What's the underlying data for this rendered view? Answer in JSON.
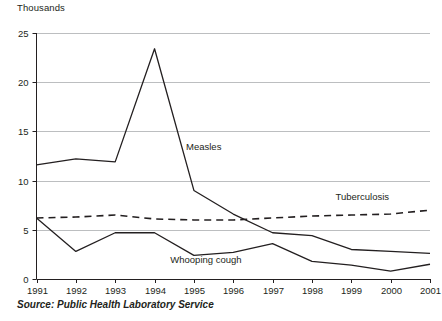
{
  "units_label": "Thousands",
  "source_note": "Source: Public Health Laboratory Service",
  "labels": {
    "measles": "Measles",
    "tuberculosis": "Tuberculosis",
    "whooping_cough": "Whooping cough"
  },
  "colors": {
    "line": "#231f20",
    "grid": "#bcbec0",
    "axis": "#231f20",
    "background": "#ffffff"
  },
  "chart_data": {
    "type": "line",
    "title": "",
    "subtitle": "",
    "xlabel": "",
    "ylabel": "Thousands",
    "xlim": [
      1991,
      2001
    ],
    "ylim": [
      0,
      25
    ],
    "yticks": [
      0,
      5,
      10,
      15,
      20,
      25
    ],
    "grid": true,
    "legend": "inline-labels",
    "categories": [
      1991,
      1992,
      1993,
      1994,
      1995,
      1996,
      1997,
      1998,
      1999,
      2000,
      2001
    ],
    "xtick_labels": [
      "1991",
      "1992",
      "1993",
      "1994",
      "1995",
      "1996",
      "1997",
      "1998",
      "1999",
      "2000",
      "2001"
    ],
    "ytick_labels": [
      "0",
      "5",
      "10",
      "15",
      "20",
      "25"
    ],
    "series": [
      {
        "name": "Measles",
        "style": "solid",
        "values": [
          11.6,
          12.2,
          11.9,
          23.4,
          9.0,
          6.6,
          4.7,
          4.4,
          3.0,
          2.8,
          2.6
        ]
      },
      {
        "name": "Tuberculosis",
        "style": "dashed",
        "values": [
          6.2,
          6.3,
          6.5,
          6.1,
          6.0,
          6.0,
          6.2,
          6.4,
          6.5,
          6.6,
          7.0
        ]
      },
      {
        "name": "Whooping cough",
        "style": "solid",
        "values": [
          6.2,
          2.8,
          4.7,
          4.7,
          2.4,
          2.7,
          3.6,
          1.8,
          1.4,
          0.8,
          1.5
        ]
      }
    ],
    "annotations": [
      {
        "text": "Measles",
        "x": 1994.8,
        "y": 13.1
      },
      {
        "text": "Tuberculosis",
        "x": 1998.6,
        "y": 8.0
      },
      {
        "text": "Whooping cough",
        "x": 1994.4,
        "y": 1.6
      }
    ]
  }
}
